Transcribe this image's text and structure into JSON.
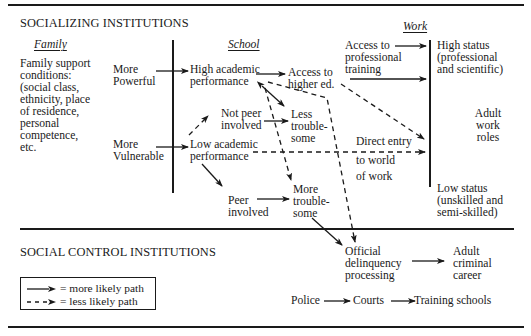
{
  "sections": {
    "socializing": "SOCIALIZING INSTITUTIONS",
    "social_control": "SOCIAL CONTROL INSTITUTIONS"
  },
  "columns": {
    "family": "Family",
    "school": "School",
    "work": "Work"
  },
  "family": {
    "conditions": [
      "Family support",
      "conditions:",
      "(social class,",
      "ethnicity, place",
      "of residence,",
      "personal",
      "competence,",
      "etc."
    ]
  },
  "inputs": {
    "more_powerful": [
      "More",
      "Powerful"
    ],
    "more_vulnerable": [
      "More",
      "Vulnerable"
    ]
  },
  "school": {
    "high_academic": [
      "High academic",
      "performance"
    ],
    "low_academic": [
      "Low academic",
      "performance"
    ],
    "not_peer": [
      "Not peer",
      "involved"
    ],
    "peer": [
      "Peer",
      "involved"
    ],
    "less_trouble": [
      "Less",
      "trouble-",
      "some"
    ],
    "more_trouble": [
      "More",
      "trouble-",
      "some"
    ],
    "access_higher_ed": [
      "Access to",
      "higher ed."
    ]
  },
  "work": {
    "access_prof_training": [
      "Access to",
      "professional",
      "training"
    ],
    "direct_entry": [
      "Direct entry",
      "to world",
      "of work"
    ],
    "high_status": [
      "High status",
      "(professional",
      "and scientific)"
    ],
    "adult_work_roles": [
      "Adult",
      "work",
      "roles"
    ],
    "low_status": [
      "Low status",
      "(unskilled and",
      "semi-skilled)"
    ]
  },
  "control": {
    "official_delinquency": [
      "Official",
      "delinquency",
      "processing"
    ],
    "adult_criminal": [
      "Adult",
      "criminal",
      "career"
    ],
    "pipeline": [
      "Police",
      "Courts",
      "Training schools"
    ]
  },
  "legend": {
    "solid": "= more likely path",
    "dashed": "= less likely path"
  },
  "colors": {
    "ink": "#1a1a1a",
    "background": "#ffffff"
  }
}
